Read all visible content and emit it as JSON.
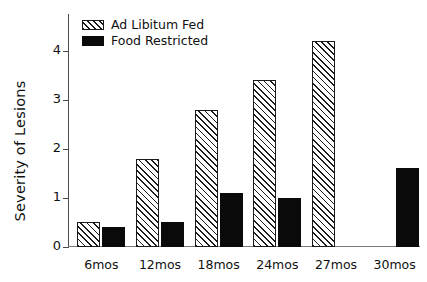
{
  "chart_data": {
    "type": "bar",
    "title": "",
    "subtitle": "",
    "xlabel": "",
    "ylabel": "Severity of Lesions",
    "categories": [
      "6mos",
      "12mos",
      "18mos",
      "24mos",
      "27mos",
      "30mos"
    ],
    "series": [
      {
        "name": "Ad Libitum Fed",
        "pattern": "diagonal-hatch",
        "color": "#ffffff",
        "edge_color": "#1a1a1a",
        "values": [
          0.5,
          1.8,
          2.8,
          3.4,
          4.2,
          null
        ]
      },
      {
        "name": "Food Restricted",
        "pattern": "solid",
        "color": "#0a0a0a",
        "edge_color": "#0a0a0a",
        "values": [
          0.4,
          0.5,
          1.1,
          1.0,
          null,
          1.62
        ]
      }
    ],
    "ylim": [
      0,
      4.75
    ],
    "yticks": [
      0,
      1,
      2,
      3,
      4
    ],
    "ytick_labels": [
      "0",
      "1",
      "2",
      "3",
      "4"
    ],
    "grid": false,
    "legend_position": "top-left",
    "axis_color": "#4b4b4b"
  },
  "legend": {
    "entries": [
      {
        "label": "Ad Libitum Fed",
        "swatch": "hatched-swatch"
      },
      {
        "label": "Food Restricted",
        "swatch": "solid-swatch"
      }
    ]
  }
}
